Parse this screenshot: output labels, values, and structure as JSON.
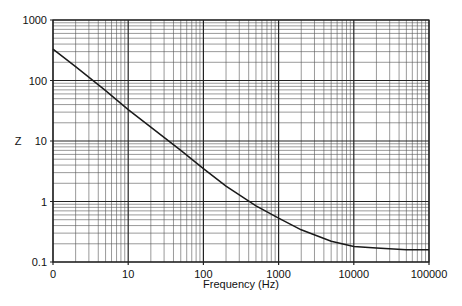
{
  "chart_data": {
    "type": "line",
    "title": "",
    "xlabel": "Frequency (Hz)",
    "ylabel": "Z",
    "xscale": "log",
    "yscale": "log",
    "xlim": [
      1,
      100000
    ],
    "ylim": [
      0.1,
      1000
    ],
    "grid": true,
    "legend": null,
    "x_tick_labels": [
      "0",
      "10",
      "100",
      "1000",
      "10000",
      "100000"
    ],
    "y_tick_labels": [
      "0.1",
      "1",
      "10",
      "100",
      "1000"
    ],
    "series": [
      {
        "name": "Z",
        "x": [
          1,
          2,
          5,
          10,
          20,
          50,
          100,
          200,
          500,
          1000,
          2000,
          5000,
          10000,
          20000,
          50000,
          100000
        ],
        "values": [
          330,
          170,
          68,
          33,
          17,
          7,
          3.5,
          1.8,
          0.85,
          0.53,
          0.34,
          0.22,
          0.18,
          0.17,
          0.16,
          0.16
        ]
      }
    ]
  }
}
